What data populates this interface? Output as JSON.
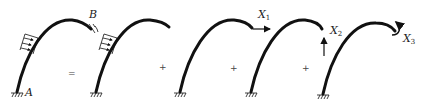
{
  "diagram": {
    "colors": {
      "stroke": "#111111",
      "background": "#ffffff"
    },
    "panels": [
      {
        "id": "original",
        "labels": {
          "support_left": "A",
          "support_right": "B"
        },
        "has_load": true
      },
      {
        "id": "basic-with-load",
        "has_load": true
      },
      {
        "id": "redundant-x1",
        "force_label": "X",
        "force_sub": "1",
        "force_type": "horizontal-arrow"
      },
      {
        "id": "redundant-x2",
        "force_label": "X",
        "force_sub": "2",
        "force_type": "vertical-arrow"
      },
      {
        "id": "redundant-x3",
        "force_label": "X",
        "force_sub": "3",
        "force_type": "moment"
      }
    ],
    "operators": [
      "=",
      "+",
      "+",
      "+"
    ]
  }
}
